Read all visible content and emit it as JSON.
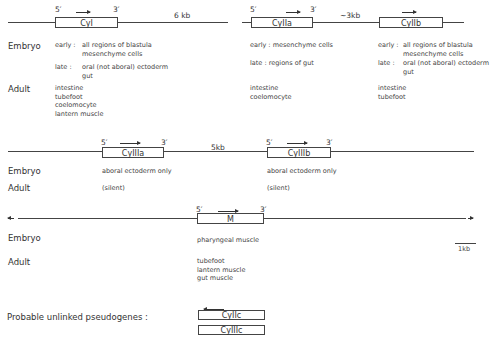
{
  "cluster1": {
    "genes": [
      {
        "name": "CyI",
        "five": "5′",
        "three": "3′"
      },
      {
        "name": "CyIIa",
        "five": "5′",
        "three": "3′"
      },
      {
        "name": "CyIIb"
      }
    ],
    "spacers": [
      "6 kb",
      "~3kb"
    ],
    "row_labels": {
      "embryo": "Embryo",
      "adult": "Adult"
    },
    "expression": [
      {
        "early_label": "early :",
        "early": [
          "all regions of blastula",
          "mesenchyme cells"
        ],
        "late_label": "late  :",
        "late": [
          "oral (not aboral) ectoderm",
          "gut"
        ],
        "adult": [
          "intestine",
          "tubefoot",
          "coelomocyte",
          "lantern muscle"
        ]
      },
      {
        "early_label": "early :",
        "early": [
          "mesenchyme cells"
        ],
        "late_label": "late  :",
        "late": [
          "regions of gut"
        ],
        "adult": [
          "intestine",
          "coelomocyte"
        ]
      },
      {
        "early_label": "early :",
        "early": [
          "all regions of blastula",
          "mesenchyme cells"
        ],
        "late_label": "late  :",
        "late": [
          "oral (not aboral) ectoderm",
          "gut"
        ],
        "adult": [
          "intestine",
          "tubefoot"
        ]
      }
    ]
  },
  "cluster2": {
    "genes": [
      {
        "name": "CyIIIa",
        "five": "5′",
        "three": "3′"
      },
      {
        "name": "CyIIIb",
        "five": "5′",
        "three": "3′"
      }
    ],
    "spacer": "5kb",
    "row_labels": {
      "embryo": "Embryo",
      "adult": "Adult"
    },
    "expression": [
      {
        "embryo": "aboral ectoderm only",
        "adult": "(silent)"
      },
      {
        "embryo": "aboral ectoderm only",
        "adult": "(silent)"
      }
    ]
  },
  "cluster3": {
    "gene": {
      "name": "M",
      "five": "5′",
      "three": "3′"
    },
    "row_labels": {
      "embryo": "Embryo",
      "adult": "Adult"
    },
    "embryo": "pharyngeal muscle",
    "adult": [
      "tubefoot",
      "lantern muscle",
      "gut muscle"
    ],
    "scale": "1kb"
  },
  "pseudogenes": {
    "label": "Probable unlinked pseudogenes :",
    "genes": [
      "CyIIc",
      "CyIIIc"
    ]
  }
}
